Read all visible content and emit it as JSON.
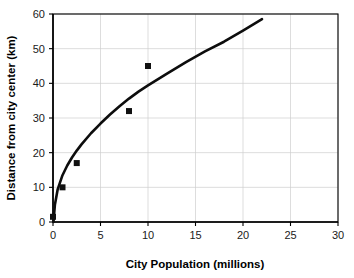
{
  "chart_data": {
    "type": "scatter",
    "title": "",
    "xlabel": "City Population (millions)",
    "ylabel": "Distance from city center (km)",
    "xlim": [
      0,
      30
    ],
    "ylim": [
      0,
      60
    ],
    "xticks": [
      0,
      5,
      10,
      15,
      20,
      25,
      30
    ],
    "yticks": [
      0,
      10,
      20,
      30,
      40,
      50,
      60
    ],
    "xtick_labels": [
      "0",
      "5",
      "10",
      "15",
      "20",
      "25",
      "30"
    ],
    "ytick_labels": [
      "0",
      "10",
      "20",
      "30",
      "40",
      "50",
      "60"
    ],
    "grid": true,
    "grid_color": "#cfcfcf",
    "legend": null,
    "marker_color": "#111111",
    "marker_shape": "square",
    "curve_color": "#0d0d0d",
    "points": [
      {
        "x": 0.0,
        "y": 1.5
      },
      {
        "x": 1.0,
        "y": 10.0
      },
      {
        "x": 2.5,
        "y": 17.0
      },
      {
        "x": 8.0,
        "y": 32.0
      },
      {
        "x": 10.0,
        "y": 45.0
      }
    ],
    "series": [
      {
        "name": "Observed cities",
        "type": "scatter",
        "x": [
          0.0,
          1.0,
          2.5,
          8.0,
          10.0
        ],
        "values": [
          1.5,
          10.0,
          17.0,
          32.0,
          45.0
        ]
      },
      {
        "name": "Fitted trend",
        "type": "line",
        "x": [
          0.05,
          0.2,
          0.5,
          1.0,
          1.5,
          2.0,
          2.5,
          3.0,
          4.0,
          5.0,
          6.0,
          7.0,
          8.0,
          9.0,
          10.0,
          12.0,
          14.0,
          16.0,
          18.0,
          20.0,
          22.0
        ],
        "values": [
          0.0,
          5.0,
          9.5,
          13.5,
          16.3,
          18.6,
          20.6,
          22.4,
          25.6,
          28.4,
          31.0,
          33.4,
          35.6,
          37.6,
          39.4,
          42.8,
          46.1,
          49.2,
          52.0,
          55.2,
          58.5
        ]
      }
    ]
  }
}
